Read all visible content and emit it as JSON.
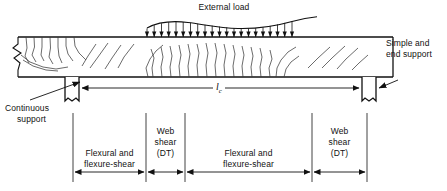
{
  "figure": {
    "title_note": "Reinforced concrete beam cracking-zone diagram",
    "colors": {
      "line": "#111111",
      "crack": "#333333",
      "background": "#ffffff"
    }
  },
  "labels": {
    "external_load": "External load",
    "simple_end_support_line1": "Simple and",
    "simple_end_support_line2": "end support",
    "continuous_support_line1": "Continuous",
    "continuous_support_line2": "support",
    "span_symbol": "l",
    "span_subscript": "c"
  },
  "zones": [
    {
      "id": "zone-flexural-left",
      "line1": "Flexural and",
      "line2": "flexure-shear",
      "x_start": 73,
      "x_end": 146
    },
    {
      "id": "zone-web-shear-left",
      "line1": "Web",
      "line2": "shear",
      "line3": "(DT)",
      "x_start": 146,
      "x_end": 185
    },
    {
      "id": "zone-flexural-mid",
      "line1": "Flexural and",
      "line2": "flexure-shear",
      "x_start": 185,
      "x_end": 312
    },
    {
      "id": "zone-web-shear-right",
      "line1": "Web",
      "line2": "shear",
      "line3": "(DT)",
      "x_start": 312,
      "x_end": 367
    }
  ],
  "beam": {
    "left_x": 18,
    "right_x": 393,
    "top_y": 37,
    "bottom_y": 77,
    "load_arrow_start": 147,
    "load_arrow_end": 292,
    "load_arrow_count": 21
  },
  "supports": {
    "continuous": {
      "x": 65,
      "width": 14,
      "label_x": 8,
      "label_y": 105
    },
    "simple_end": {
      "x": 362,
      "width": 14,
      "label_x": 385,
      "label_y": 41
    }
  }
}
